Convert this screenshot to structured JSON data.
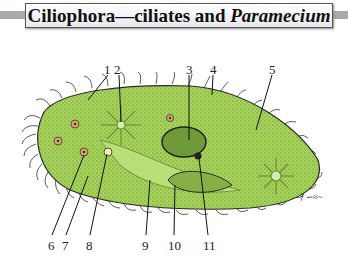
{
  "title": {
    "main": "Ciliophora—ciliates and ",
    "italic": "Paramecium"
  },
  "labels": [
    {
      "num": "1",
      "x": 104,
      "y": 62
    },
    {
      "num": "2",
      "x": 114,
      "y": 62
    },
    {
      "num": "3",
      "x": 186,
      "y": 62
    },
    {
      "num": "4",
      "x": 210,
      "y": 62
    },
    {
      "num": "5",
      "x": 269,
      "y": 62
    },
    {
      "num": "6",
      "x": 48,
      "y": 238
    },
    {
      "num": "7",
      "x": 62,
      "y": 238
    },
    {
      "num": "8",
      "x": 86,
      "y": 238
    },
    {
      "num": "9",
      "x": 142,
      "y": 238
    },
    {
      "num": "10",
      "x": 168,
      "y": 238
    },
    {
      "num": "11",
      "x": 203,
      "y": 238
    }
  ],
  "colors": {
    "body": "#a6d45a",
    "body_dark": "#7fae3c",
    "nucleus": "#6f9a3a",
    "outline": "#2a2a2a"
  },
  "signature": "artist-signature"
}
